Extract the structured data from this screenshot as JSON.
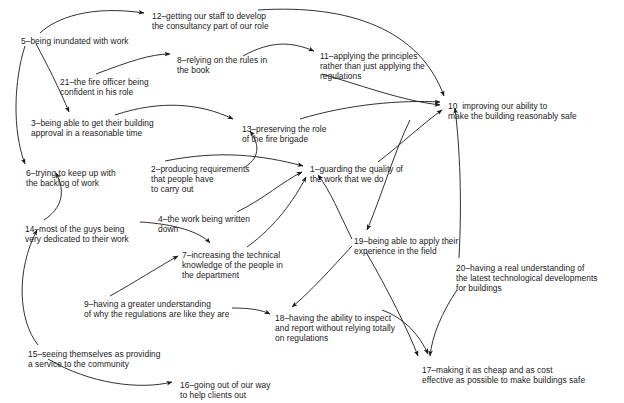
{
  "diagram": {
    "type": "causal-map",
    "background_color": "#ffffff",
    "line_color": "#1a1a1a",
    "text_color": "#1a1a1a",
    "nodes": [
      {
        "id": "n1",
        "number": "1",
        "label": "1–guarding the quality of\nthe work that we do",
        "x": 310,
        "y": 164
      },
      {
        "id": "n2",
        "number": "2",
        "label": "2–producing requirements\nthat people have\nto carry out",
        "x": 151,
        "y": 164
      },
      {
        "id": "n3",
        "number": "3",
        "label": "3–being able to get their building\napproval in a reasonable time",
        "x": 31,
        "y": 118
      },
      {
        "id": "n4",
        "number": "4",
        "label": "4–the work being written\ndown",
        "x": 158,
        "y": 214
      },
      {
        "id": "n5",
        "number": "5",
        "label": "5–being inundated with work",
        "x": 21,
        "y": 36
      },
      {
        "id": "n6",
        "number": "6",
        "label": "6–trying to keep up with\nthe backlog of work",
        "x": 26,
        "y": 168
      },
      {
        "id": "n7",
        "number": "7",
        "label": "7–increasing the technical\nknowledge of the people in\nthe department",
        "x": 182,
        "y": 250
      },
      {
        "id": "n8",
        "number": "8",
        "label": "8–relying on the rules in\nthe book",
        "x": 177,
        "y": 55
      },
      {
        "id": "n9",
        "number": "9",
        "label": "9–having a greater understanding\nof why the regulations are like they are",
        "x": 84,
        "y": 299
      },
      {
        "id": "n10",
        "number": "10",
        "label": "10  improving our ability to\nmake the building reasonably safe",
        "x": 448,
        "y": 101
      },
      {
        "id": "n11",
        "number": "11",
        "label": "11–applying the principles\nrather than just applying the\nregulations",
        "x": 320,
        "y": 51
      },
      {
        "id": "n12",
        "number": "12",
        "label": "12–getting our staff to develop\nthe consultancy part of our role",
        "x": 152,
        "y": 11
      },
      {
        "id": "n13",
        "number": "13",
        "label": "13–preserving the role\nof the fire brigade",
        "x": 242,
        "y": 124
      },
      {
        "id": "n14",
        "number": "14",
        "label": "14–most of the guys being\nvery dedicated to their work",
        "x": 25,
        "y": 224
      },
      {
        "id": "n15",
        "number": "15",
        "label": "15–seeing themselves as providing\na service to the community",
        "x": 28,
        "y": 349
      },
      {
        "id": "n16",
        "number": "16",
        "label": "16–going out of our way\nto help clients out",
        "x": 180,
        "y": 380
      },
      {
        "id": "n17",
        "number": "17",
        "label": "17–making it as cheap and as cost\neffective as possible to make buildings safe",
        "x": 422,
        "y": 365
      },
      {
        "id": "n18",
        "number": "18",
        "label": "18–having the ability to inspect\nand report without relying totally\non regulations",
        "x": 275,
        "y": 313
      },
      {
        "id": "n19",
        "number": "19",
        "label": "19–being able to apply their\nexperience in the field",
        "x": 354,
        "y": 236
      },
      {
        "id": "n20",
        "number": "20",
        "label": "20–having a real understanding of\nthe latest technological developments\nfor buildings",
        "x": 456,
        "y": 263
      },
      {
        "id": "n21",
        "number": "21",
        "label": "21–the fire officer being\nconfident in his role",
        "x": 60,
        "y": 77
      }
    ],
    "edges": [
      {
        "from": "5",
        "to": "12",
        "path": "M 40 33 C 56 18 90 5 144 13"
      },
      {
        "from": "5",
        "to": "3",
        "path": "M 36 44 C 46 62 60 90 69 112"
      },
      {
        "from": "5",
        "to": "6",
        "path": "M 25 46 C 14 80 12 130 25 164"
      },
      {
        "from": "21",
        "to": "8",
        "path": "M 96 74 C 128 62 150 54 170 54"
      },
      {
        "from": "3",
        "to": "13",
        "path": "M 115 115 C 160 100 200 103 233 119"
      },
      {
        "from": "8",
        "to": "11",
        "path": "M 243 56 C 272 40 292 42 314 51"
      },
      {
        "from": "12",
        "to": "10",
        "path": "M 258 10 C 350 4 420 30 444 96"
      },
      {
        "from": "11",
        "to": "10",
        "path": "M 322 74 C 370 88 400 100 440 105"
      },
      {
        "from": "13",
        "to": "10",
        "path": "M 300 119 C 350 104 400 100 440 102"
      },
      {
        "from": "2",
        "to": "13",
        "path": "M 245 167 C 262 156 258 142 250 131"
      },
      {
        "from": "2",
        "to": "1",
        "path": "M 165 161 C 220 150 262 155 303 166"
      },
      {
        "from": "4",
        "to": "1",
        "path": "M 237 212 C 265 198 282 182 302 172"
      },
      {
        "from": "7",
        "to": "1",
        "path": "M 247 247 C 276 226 294 200 306 177"
      },
      {
        "from": "1",
        "to": "10",
        "path": "M 378 162 C 400 145 425 122 442 110"
      },
      {
        "from": "20",
        "to": "10",
        "path": "M 459 258 C 462 200 460 150 455 108"
      },
      {
        "from": "10",
        "to": "19",
        "path": "M 410 120 C 395 150 380 200 367 230"
      },
      {
        "from": "19",
        "to": "1",
        "path": "M 352 239 C 340 215 330 190 318 175"
      },
      {
        "from": "14",
        "to": "6",
        "path": "M 44 220 C 62 208 66 192 56 173"
      },
      {
        "from": "15",
        "to": "14",
        "path": "M 38 345 C 18 320 16 270 37 230"
      },
      {
        "from": "14",
        "to": "7",
        "path": "M 140 222 C 175 224 200 232 210 243"
      },
      {
        "from": "9",
        "to": "7",
        "path": "M 110 296 C 135 282 160 266 178 256"
      },
      {
        "from": "9",
        "to": "18",
        "path": "M 232 308 C 250 308 262 310 270 314"
      },
      {
        "from": "19",
        "to": "18",
        "path": "M 352 246 C 330 270 310 292 292 307"
      },
      {
        "from": "15",
        "to": "16",
        "path": "M 48 359 C 90 384 140 390 172 382"
      },
      {
        "from": "18",
        "to": "17",
        "path": "M 382 310 C 405 318 420 336 428 354"
      },
      {
        "from": "19",
        "to": "17",
        "path": "M 366 252 C 388 290 408 330 418 356"
      },
      {
        "from": "20",
        "to": "17",
        "path": "M 457 290 C 442 312 432 336 430 356"
      }
    ]
  }
}
